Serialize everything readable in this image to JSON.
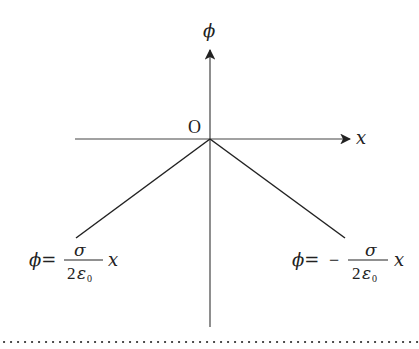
{
  "diagram": {
    "type": "potential-vs-position plot (infinite charged plane)",
    "axes": {
      "x_label": "x",
      "y_label": "ϕ",
      "origin_label": "O"
    },
    "branches": [
      {
        "side": "left",
        "lhs": "ϕ=",
        "sign": "",
        "numerator": "σ",
        "denominator_coeff": "2",
        "denominator_symbol": "ε",
        "denominator_subscript": "0",
        "variable": "x"
      },
      {
        "side": "right",
        "lhs": "ϕ=",
        "sign": "−",
        "numerator": "σ",
        "denominator_coeff": "2",
        "denominator_symbol": "ε",
        "denominator_subscript": "0",
        "variable": "x"
      }
    ],
    "colors": {
      "ink": "#222222",
      "axis": "#444444",
      "background": "#ffffff"
    }
  }
}
